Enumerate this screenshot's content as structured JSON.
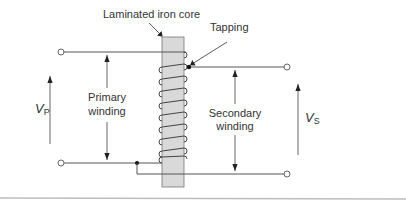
{
  "diagram": {
    "type": "autotransformer-schematic",
    "labels": {
      "core": "Laminated iron core",
      "tapping": "Tapping",
      "primary_line1": "Primary",
      "primary_line2": "winding",
      "secondary_line1": "Secondary",
      "secondary_line2": "winding",
      "vp_main": "V",
      "vp_sub": "P",
      "vs_main": "V",
      "vs_sub": "S"
    },
    "colors": {
      "core_fill": "#d9d9d9",
      "core_stroke": "#777777",
      "line": "#555555",
      "text": "#333333",
      "bottom_rule": "#bdbdbd"
    },
    "coil_turns": 8
  }
}
